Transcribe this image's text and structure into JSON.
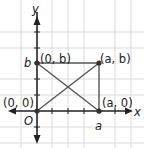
{
  "diagram": {
    "type": "coordinate-plane",
    "axes": {
      "x_label": "x",
      "y_label": "y",
      "origin_label": "O"
    },
    "tick_labels": {
      "x": "a",
      "y": "b"
    },
    "points": [
      {
        "id": "origin",
        "label": "(0, 0)"
      },
      {
        "id": "top-left",
        "label": "(0, b)"
      },
      {
        "id": "top-right",
        "label": "(a, b)"
      },
      {
        "id": "bottom-right",
        "label": "(a, 0)"
      }
    ],
    "shape": "rectangle with both diagonals",
    "colors": {
      "grid": "#d9d9d9",
      "axis": "#222222",
      "shape": "#555555",
      "point": "#333333"
    }
  }
}
